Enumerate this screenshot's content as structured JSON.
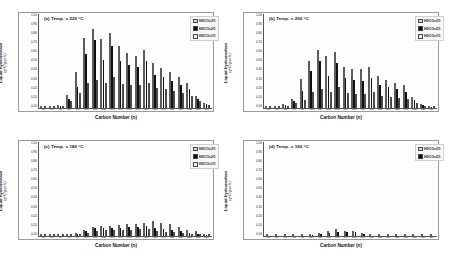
{
  "figure": {
    "xlabel": "Carbon Number (n)",
    "ylabel": "Liquid hydrocarbon",
    "yunit": "(gHC/gcat·hr)",
    "series_names": [
      "H2/CO=3/1",
      "H2/CO=2/1",
      "H2/CO=1/1"
    ],
    "series_colors": [
      "#d9d9d9",
      "#111111",
      "#f4f4f4"
    ],
    "categories": [
      "C5",
      "C6",
      "C7",
      "C8",
      "C9",
      "C10",
      "C11",
      "C12",
      "C13",
      "C14",
      "C15",
      "C16",
      "C17",
      "C18",
      "C19",
      "C20",
      "C21",
      "C22",
      "C23",
      "C24"
    ],
    "yticks": [
      "1.00",
      "0.90",
      "0.80",
      "0.70",
      "0.60",
      "0.50",
      "0.40",
      "0.30",
      "0.20",
      "0.10",
      "0.00"
    ],
    "ylim": [
      0,
      1.0
    ]
  },
  "chart_data": [
    {
      "type": "bar",
      "panel": "a",
      "title": "(a) Temp. = 220 °C",
      "temperature_c": 220,
      "xlabel": "Carbon Number (n)",
      "ylabel": "Liquid hydrocarbon (gHC/gcat·hr)",
      "ylim": [
        0,
        1.0
      ],
      "grid": false,
      "legend_position": "top-right",
      "categories": [
        "C5",
        "C6",
        "C7",
        "C8",
        "C9",
        "C10",
        "C11",
        "C12",
        "C13",
        "C14",
        "C15",
        "C16",
        "C17",
        "C18",
        "C19",
        "C20",
        "C21",
        "C22",
        "C23",
        "C24"
      ],
      "series": [
        {
          "name": "H2/CO=3/1",
          "values": [
            0.0,
            0.0,
            0.03,
            0.14,
            0.38,
            0.75,
            0.84,
            0.73,
            0.8,
            0.66,
            0.58,
            0.55,
            0.62,
            0.48,
            0.43,
            0.38,
            0.33,
            0.27,
            0.13,
            0.05
          ]
        },
        {
          "name": "H2/CO=2/1",
          "values": [
            0.0,
            0.0,
            0.02,
            0.1,
            0.22,
            0.57,
            0.72,
            0.51,
            0.66,
            0.5,
            0.46,
            0.44,
            0.5,
            0.35,
            0.33,
            0.29,
            0.25,
            0.2,
            0.1,
            0.04
          ]
        },
        {
          "name": "H2/CO=1/1",
          "values": [
            0.0,
            0.0,
            0.01,
            0.07,
            0.16,
            0.27,
            0.3,
            0.27,
            0.33,
            0.26,
            0.25,
            0.25,
            0.27,
            0.21,
            0.2,
            0.18,
            0.16,
            0.13,
            0.07,
            0.03
          ]
        }
      ]
    },
    {
      "type": "bar",
      "panel": "b",
      "title": "(b) Temp. = 200 °C",
      "temperature_c": 200,
      "xlabel": "Carbon Number (n)",
      "ylabel": "Liquid hydrocarbon (gHC/gcat·hr)",
      "ylim": [
        0,
        1.0
      ],
      "grid": false,
      "legend_position": "top-right",
      "categories": [
        "C5",
        "C6",
        "C7",
        "C8",
        "C9",
        "C10",
        "C11",
        "C12",
        "C13",
        "C14",
        "C15",
        "C16",
        "C17",
        "C18",
        "C19",
        "C20",
        "C21",
        "C22",
        "C23",
        "C24"
      ],
      "series": [
        {
          "name": "H2/CO=3/1",
          "values": [
            0.0,
            0.0,
            0.04,
            0.1,
            0.31,
            0.5,
            0.62,
            0.55,
            0.6,
            0.44,
            0.42,
            0.41,
            0.44,
            0.34,
            0.3,
            0.27,
            0.24,
            0.12,
            0.04,
            0.01
          ]
        },
        {
          "name": "H2/CO=2/1",
          "values": [
            0.0,
            0.0,
            0.03,
            0.07,
            0.18,
            0.39,
            0.5,
            0.34,
            0.48,
            0.32,
            0.3,
            0.29,
            0.32,
            0.25,
            0.22,
            0.2,
            0.17,
            0.09,
            0.03,
            0.01
          ]
        },
        {
          "name": "H2/CO=1/1",
          "values": [
            0.0,
            0.0,
            0.01,
            0.05,
            0.09,
            0.17,
            0.2,
            0.17,
            0.22,
            0.16,
            0.15,
            0.15,
            0.17,
            0.13,
            0.12,
            0.11,
            0.1,
            0.05,
            0.02,
            0.01
          ]
        }
      ]
    },
    {
      "type": "bar",
      "panel": "c",
      "title": "(c) Temp. = 180 °C",
      "temperature_c": 180,
      "xlabel": "Carbon Number (n)",
      "ylabel": "Liquid hydrocarbon (gHC/gcat·hr)",
      "ylim": [
        0,
        1.0
      ],
      "grid": false,
      "legend_position": "top-right",
      "categories": [
        "C5",
        "C6",
        "C7",
        "C8",
        "C9",
        "C10",
        "C11",
        "C12",
        "C13",
        "C14",
        "C15",
        "C16",
        "C17",
        "C18",
        "C19",
        "C20",
        "C21",
        "C22",
        "C23",
        "C24"
      ],
      "series": [
        {
          "name": "H2/CO=3/1",
          "values": [
            0.0,
            0.0,
            0.0,
            0.0,
            0.03,
            0.06,
            0.1,
            0.11,
            0.11,
            0.12,
            0.13,
            0.13,
            0.14,
            0.16,
            0.14,
            0.13,
            0.1,
            0.06,
            0.05,
            0.02
          ]
        },
        {
          "name": "H2/CO=2/1",
          "values": [
            0.0,
            0.0,
            0.0,
            0.0,
            0.02,
            0.05,
            0.08,
            0.09,
            0.09,
            0.09,
            0.1,
            0.1,
            0.11,
            0.09,
            0.07,
            0.06,
            0.05,
            0.03,
            0.02,
            0.01
          ]
        },
        {
          "name": "H2/CO=1/1",
          "values": [
            0.0,
            0.0,
            0.0,
            0.0,
            0.01,
            0.03,
            0.05,
            0.06,
            0.06,
            0.06,
            0.06,
            0.07,
            0.07,
            0.05,
            0.04,
            0.04,
            0.03,
            0.02,
            0.01,
            0.0
          ]
        }
      ]
    },
    {
      "type": "bar",
      "panel": "d",
      "title": "(d) Temp. = 160 °C",
      "temperature_c": 160,
      "xlabel": "Carbon Number (n)",
      "ylabel": "Liquid hydrocarbon (gHC/gcat·hr)",
      "ylim": [
        0,
        1.0
      ],
      "grid": false,
      "legend_position": "top-right",
      "categories": [
        "C5",
        "C6",
        "C7",
        "C8",
        "C9",
        "C10",
        "C11",
        "C12",
        "C13",
        "C14",
        "C15",
        "C16",
        "C17",
        "C18",
        "C19",
        "C20",
        "C21",
        "C22",
        "C23",
        "C24"
      ],
      "series": [
        {
          "name": "H2/CO=3/1",
          "values": [
            0.0,
            0.0,
            0.0,
            0.0,
            0.0,
            0.01,
            0.03,
            0.05,
            0.07,
            0.05,
            0.05,
            0.03,
            0.0,
            0.0,
            0.0,
            0.0,
            0.0,
            0.0,
            0.0,
            0.0
          ]
        },
        {
          "name": "H2/CO=2/1",
          "values": [
            0.0,
            0.0,
            0.0,
            0.0,
            0.0,
            0.01,
            0.02,
            0.03,
            0.04,
            0.04,
            0.04,
            0.02,
            0.0,
            0.0,
            0.0,
            0.0,
            0.0,
            0.0,
            0.0,
            0.0
          ]
        }
      ]
    }
  ]
}
